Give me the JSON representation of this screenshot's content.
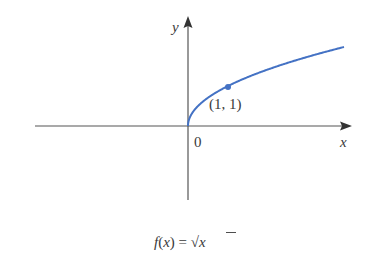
{
  "chart_data": {
    "type": "line",
    "title": "f(x) = √x",
    "xlabel": "x",
    "ylabel": "y",
    "origin_label": "0",
    "function": "sqrt(x)",
    "series": [
      {
        "name": "f(x) = √x",
        "color": "#4472c4",
        "x": [
          0,
          0.05,
          0.1,
          0.25,
          0.5,
          1,
          1.5,
          2,
          2.5,
          3,
          3.5,
          3.9
        ],
        "y": [
          0,
          0.224,
          0.316,
          0.5,
          0.707,
          1,
          1.225,
          1.414,
          1.581,
          1.732,
          1.871,
          1.975
        ]
      }
    ],
    "annotations": [
      {
        "point": [
          1,
          1
        ],
        "label": "(1, 1)"
      }
    ],
    "grid": false,
    "legend": null
  },
  "labels": {
    "y_axis": "y",
    "x_axis": "x",
    "origin": "0",
    "point": "(1, 1)",
    "caption_f": "f",
    "caption_open": "(",
    "caption_x": "x",
    "caption_close": ") = √",
    "caption_x2": "x"
  },
  "colors": {
    "curve": "#4472c4",
    "axis": "#555555",
    "text": "#3a3a3a"
  }
}
